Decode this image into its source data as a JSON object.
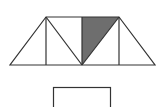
{
  "diagram": {
    "type": "geometric-figure",
    "colors": {
      "stroke": "#333333",
      "shade": "#6e6e6e",
      "background": "#ffffff"
    },
    "trapezoid": {
      "top_left": [
        46,
        17
      ],
      "top_right": [
        119,
        17
      ],
      "bottom_left": [
        10,
        65
      ],
      "bottom_right": [
        155,
        65
      ],
      "bottom_center": [
        82,
        65
      ]
    },
    "shaded_triangle": [
      [
        82,
        17
      ],
      [
        119,
        17
      ],
      [
        82,
        65
      ]
    ],
    "rectangle": {
      "x": 53,
      "y": 87,
      "width": 58,
      "height": 24
    }
  }
}
